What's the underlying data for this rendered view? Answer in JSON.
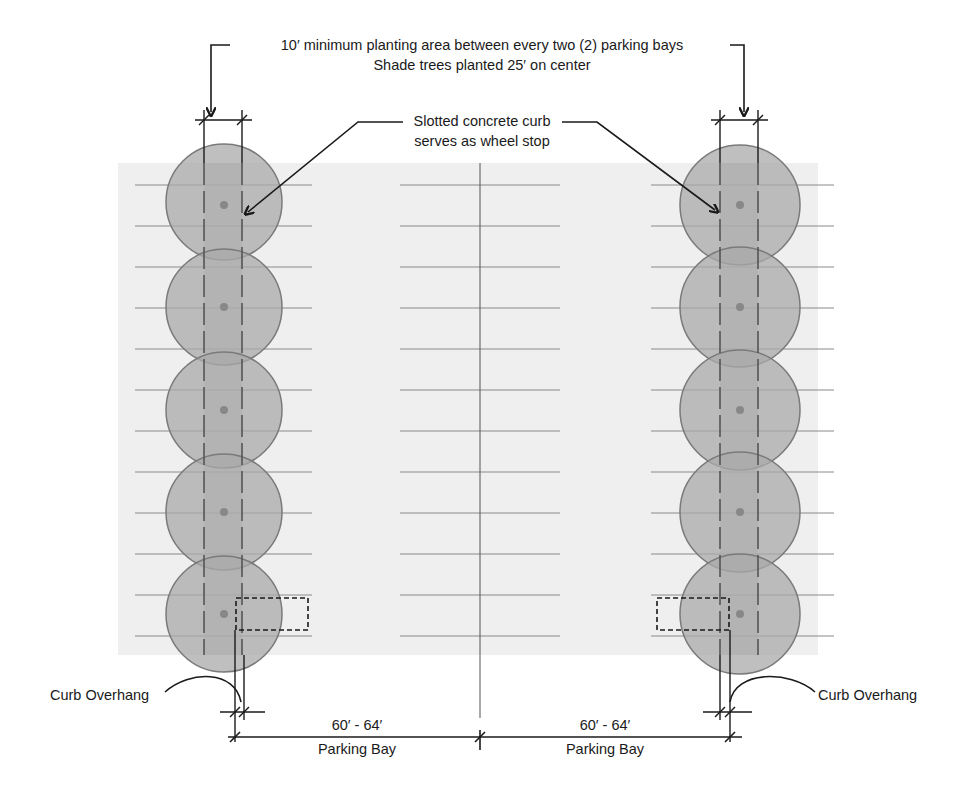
{
  "diagram": {
    "title_line1": "10′ minimum planting area between every two (2) parking bays",
    "title_line2": "Shade trees planted 25′ on center",
    "curb_callout_line1": "Slotted concrete curb",
    "curb_callout_line2": "serves as wheel stop",
    "left_overhang_label": "Curb Overhang",
    "right_overhang_label": "Curb Overhang",
    "bays": [
      {
        "dimension": "60′ - 64′",
        "label": "Parking Bay"
      },
      {
        "dimension": "60′ - 64′",
        "label": "Parking Bay"
      }
    ],
    "tree_rows": [
      {
        "side": "left",
        "center_x": 224,
        "tree_count": 5
      },
      {
        "side": "right",
        "center_x": 740,
        "tree_count": 5
      }
    ],
    "colors": {
      "pavement": "#efefef",
      "tree_canopy": "#a9a9a9",
      "planting_strip": "#b3b3b3",
      "line": "#1a1a1a",
      "stall_line": "#8a8a8a"
    }
  }
}
